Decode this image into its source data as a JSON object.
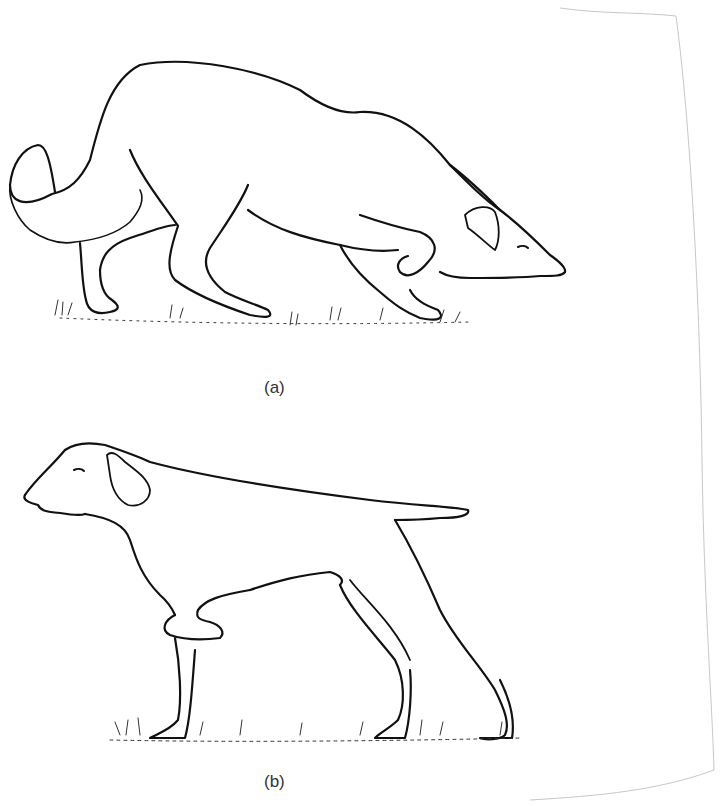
{
  "figure": {
    "panels": [
      {
        "label": "(a)",
        "subject": "crouching-herding-dog"
      },
      {
        "label": "(b)",
        "subject": "pointing-dog"
      }
    ]
  },
  "colors": {
    "ink": "#111111",
    "paper": "#ffffff",
    "margin_line": "#c8c8c8",
    "caption": "#333333"
  }
}
